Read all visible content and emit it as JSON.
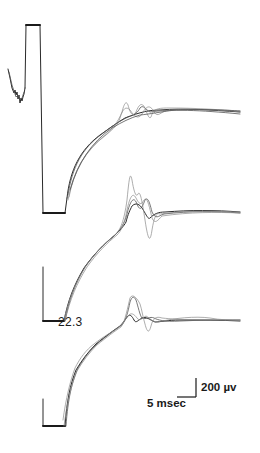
{
  "figure": {
    "panels": [
      {
        "id": "top",
        "description": "stimulus artifact with superimposed evoked response traces"
      },
      {
        "id": "middle",
        "description": "superimposed traces with large biphasic response"
      },
      {
        "id": "bottom",
        "description": "superimposed traces with annotated latency",
        "annotation": "22.3"
      }
    ],
    "annotation_label": "22.3",
    "scale_bar": {
      "vertical_label": "200 µv",
      "horizontal_label": "5 msec"
    },
    "colors": {
      "trace": "#2a2a2a",
      "background": "#ffffff"
    }
  }
}
